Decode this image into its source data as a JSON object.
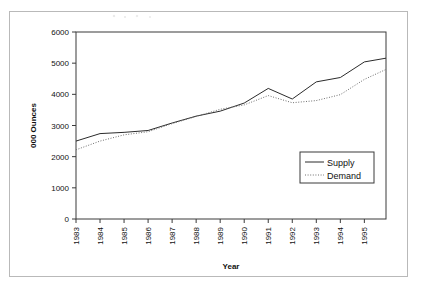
{
  "figure": {
    "border_color": "#b9b9b9",
    "background": "#ffffff"
  },
  "chart_data": {
    "type": "line",
    "title": "",
    "xlabel": "Year",
    "ylabel": "000 Ounces",
    "xlim": [
      1983,
      1995.9
    ],
    "ylim": [
      0,
      6000
    ],
    "grid": false,
    "legend_position": "inside-lower-right",
    "categories": [
      "1983",
      "1984",
      "1985",
      "1986",
      "1987",
      "1988",
      "1989",
      "1990",
      "1991",
      "1992",
      "1993",
      "1994",
      "1995",
      "1995.9"
    ],
    "x": [
      1983,
      1984,
      1985,
      1986,
      1987,
      1988,
      1989,
      1990,
      1991,
      1992,
      1993,
      1994,
      1995,
      1995.9
    ],
    "series": [
      {
        "name": "Supply",
        "style": "solid",
        "color": "#2b2b2b",
        "values": [
          2500,
          2740,
          2780,
          2840,
          3080,
          3300,
          3460,
          3720,
          4190,
          3850,
          4400,
          4540,
          5040,
          5160
        ]
      },
      {
        "name": "Demand",
        "style": "dotted",
        "color": "#6f6f6f",
        "values": [
          2220,
          2500,
          2700,
          2800,
          3060,
          3290,
          3520,
          3660,
          3960,
          3730,
          3800,
          3990,
          4480,
          4800
        ]
      }
    ],
    "y_ticks": [
      0,
      1000,
      2000,
      3000,
      4000,
      5000,
      6000
    ],
    "y_tick_labels": [
      "0",
      "1000",
      "2000",
      "3000",
      "4000",
      "5000",
      "6000"
    ],
    "x_ticks": [
      1983,
      1984,
      1985,
      1986,
      1987,
      1988,
      1989,
      1990,
      1991,
      1992,
      1993,
      1994,
      1995
    ],
    "x_tick_labels": [
      "1983",
      "1984",
      "1985",
      "1986",
      "1987",
      "1988",
      "1989",
      "1990",
      "1991",
      "1992",
      "1993",
      "1994",
      "1995"
    ],
    "legend": [
      {
        "label": "Supply",
        "style": "solid"
      },
      {
        "label": "Demand",
        "style": "dotted"
      }
    ]
  }
}
